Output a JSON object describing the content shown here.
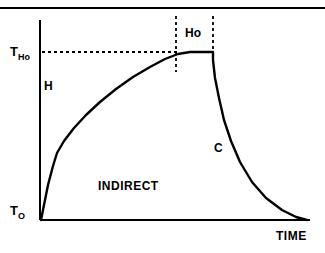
{
  "figure": {
    "background_color": "#ffffff",
    "ink_color": "#000000",
    "top_rule": {
      "name": "top-horizontal-rule",
      "x1": 0,
      "x2": 325,
      "y": 8,
      "width": 2
    }
  },
  "chart_data": {
    "type": "line",
    "title": "",
    "subtitle": "",
    "xlabel": "TIME",
    "ylabel": "",
    "grid": false,
    "legend": "none",
    "axes": {
      "y_axis": {
        "x": 40,
        "y_top": 20,
        "y_bottom": 220,
        "width": 2
      },
      "x_axis": {
        "y": 220,
        "x_left": 40,
        "x_right": 310,
        "width": 2
      }
    },
    "tick_labels": [
      {
        "name": "t-ho",
        "base": "T",
        "sub": "Ho",
        "x": 10,
        "y": 56,
        "axis": "y"
      },
      {
        "name": "t-o",
        "base": "T",
        "sub": "O",
        "x": 10,
        "y": 215,
        "axis": "y"
      }
    ],
    "axis_labels": [
      {
        "name": "time-axis-label",
        "text": "TIME",
        "x": 276,
        "y": 240
      }
    ],
    "annotations": [
      {
        "name": "heating-label",
        "text": "H",
        "x": 44,
        "y": 90
      },
      {
        "name": "hold-label",
        "text": "Ho",
        "x": 185,
        "y": 37
      },
      {
        "name": "cooling-label",
        "text": "C",
        "x": 214,
        "y": 152
      },
      {
        "name": "indirect-label",
        "text": "INDIRECT",
        "x": 98,
        "y": 190
      }
    ],
    "reference_lines": [
      {
        "name": "t-ho-level-dashed",
        "orientation": "horizontal",
        "y": 52,
        "x1": 42,
        "x2": 178,
        "dash": "3,3"
      },
      {
        "name": "hold-start-dashed",
        "orientation": "vertical",
        "x": 176,
        "y1": 16,
        "y2": 72,
        "dash": "3,3"
      },
      {
        "name": "hold-end-dashed",
        "orientation": "vertical",
        "x": 213,
        "y1": 16,
        "y2": 52,
        "dash": "3,3"
      }
    ],
    "series": [
      {
        "name": "thermal-cycle-curve",
        "label": "Indirect thermal cycle",
        "stroke_width": 2.4,
        "phases": [
          "heating",
          "hold",
          "cooling"
        ],
        "path": "M 41 220 L 48 185 L 53 166 L 57 153 L 64 141 L 74 128 L 86 115 L 100 102 L 116 89 L 133 77 L 150 67 L 165 59 L 178 54 L 190 52 L 213 52 L 213 60 L 215 78 L 219 98 L 224 120 L 231 141 L 240 162 L 252 182 L 266 198 L 282 210 L 296 217 L 307 220",
        "points": [
          {
            "x": 0,
            "y": 0,
            "note": "T-O origin"
          },
          {
            "x": 0.06,
            "y": 0.4,
            "note": "steep initial rise kink"
          },
          {
            "x": 0.42,
            "y": 0.8,
            "note": "gradual approach"
          },
          {
            "x": 0.55,
            "y": 0.97,
            "note": "hold start"
          },
          {
            "x": 0.64,
            "y": 1.0,
            "note": "T-Ho plateau end"
          },
          {
            "x": 0.65,
            "y": 0.7,
            "note": "abrupt quench"
          },
          {
            "x": 0.8,
            "y": 0.25,
            "note": "cooling tail"
          },
          {
            "x": 1.0,
            "y": 0.0,
            "note": "returns to T-O"
          }
        ]
      }
    ]
  }
}
